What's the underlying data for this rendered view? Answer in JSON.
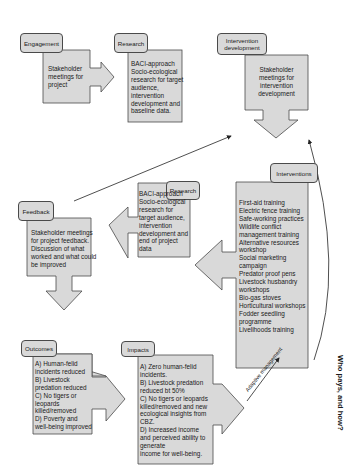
{
  "diagram": {
    "nodes": {
      "engagement": {
        "title": "Engagement",
        "lines": [
          "Stakeholder",
          "meetings for",
          "project"
        ]
      },
      "research_baseline": {
        "title": "Research",
        "lines": [
          "BACI-approach",
          "Socio-ecological",
          "research for target",
          "audience,",
          "intervention",
          "development and",
          "baseline data."
        ]
      },
      "intervention_development": {
        "title_lines": [
          "Intervention",
          "development"
        ],
        "lines": [
          "Stakeholder",
          "meetings for",
          "intervention",
          "development"
        ]
      },
      "interventions": {
        "title": "Interventions",
        "lines": [
          "First-aid training",
          "Electric fence training",
          "Safe-working practices",
          "Wildlife conflict",
          "management training",
          "Alternative resources",
          "workshop",
          "Social marketing",
          "campaign",
          "Predator proof pens",
          "Livestock husbandry",
          "workshops",
          "Bio-gas stoves",
          "Horticultural workshops",
          "Fodder seedling",
          "programme",
          "Livelihoods training"
        ]
      },
      "research_end": {
        "title": "Research",
        "lines": [
          "BACI-approach",
          "Socio-ecological",
          "research for",
          "target audience,",
          "intervention",
          "development and",
          "end of project",
          "data"
        ]
      },
      "feedback": {
        "title": "Feedback",
        "lines": [
          "Stakeholder meetings",
          "for project feedback.",
          "Discussion of what",
          "worked and what could",
          "be improved"
        ]
      },
      "outcomes": {
        "title": "Outcomes",
        "lines": [
          "A) Human-felid",
          "incidents reduced",
          "B) Livestock",
          "predation reduced",
          "C) No tigers or",
          "leopards",
          "killed/removed",
          "D) Poverty and",
          "well-being improved"
        ]
      },
      "impacts": {
        "title": "Impacts",
        "lines": [
          "A) Zero human-felid",
          "incidents.",
          "B) Livestock predation",
          "reduced bt 50%",
          "C) No tigers or leopards",
          "killed/removed and new",
          "ecological insights from",
          "CBZ.",
          "D) Increased income",
          "and perceived ability to",
          "generate",
          "income for well-being."
        ]
      }
    },
    "annotations": {
      "adaptive_management": "Adaptive management",
      "who_pays": "Who pays, and how?"
    },
    "colors": {
      "box_fill": "#d9d9d9",
      "stroke": "#4a4a4a",
      "line": "#222222",
      "background": "#ffffff"
    }
  }
}
